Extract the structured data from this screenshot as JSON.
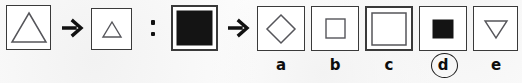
{
  "puzzle": {
    "type": "visual-analogy-matrix",
    "background_color": "#fcfcfc",
    "ink_color": "#3a3a3a",
    "fill_color": "#111111",
    "operators": {
      "transform_arrow": "→",
      "analogy_colon": ":"
    },
    "prompt_row": {
      "term_a1": {
        "shape": "triangle",
        "fill": "outline",
        "size": "large",
        "icon": "triangle-up-large-outline-icon"
      },
      "arrow_1": {
        "icon": "right-arrow-icon",
        "glyph": "→"
      },
      "term_a2": {
        "shape": "triangle",
        "fill": "outline",
        "size": "small",
        "icon": "triangle-up-small-outline-icon"
      },
      "analogy_separator": {
        "icon": "colon-icon",
        "glyph": ":"
      },
      "term_b1": {
        "shape": "square",
        "fill": "solid",
        "size": "large",
        "icon": "square-large-solid-icon"
      },
      "arrow_2": {
        "icon": "right-arrow-icon",
        "glyph": "→"
      },
      "term_b2": {
        "shape": "unknown",
        "fill": "unknown",
        "size": "unknown",
        "icon": "answer-blank-icon"
      }
    },
    "options": [
      {
        "label": "a",
        "shape": "diamond",
        "fill": "outline",
        "size": "medium",
        "icon": "diamond-outline-icon",
        "selected": false
      },
      {
        "label": "b",
        "shape": "square",
        "fill": "outline",
        "size": "small",
        "icon": "square-small-outline-icon",
        "selected": false
      },
      {
        "label": "c",
        "shape": "square",
        "fill": "outline",
        "size": "large",
        "icon": "square-large-outline-icon",
        "selected": false
      },
      {
        "label": "d",
        "shape": "square",
        "fill": "solid",
        "size": "small",
        "icon": "square-small-solid-icon",
        "selected": true
      },
      {
        "label": "e",
        "shape": "triangle-down",
        "fill": "outline",
        "size": "medium",
        "icon": "triangle-down-outline-icon",
        "selected": false
      }
    ],
    "selected_answer": "d"
  }
}
